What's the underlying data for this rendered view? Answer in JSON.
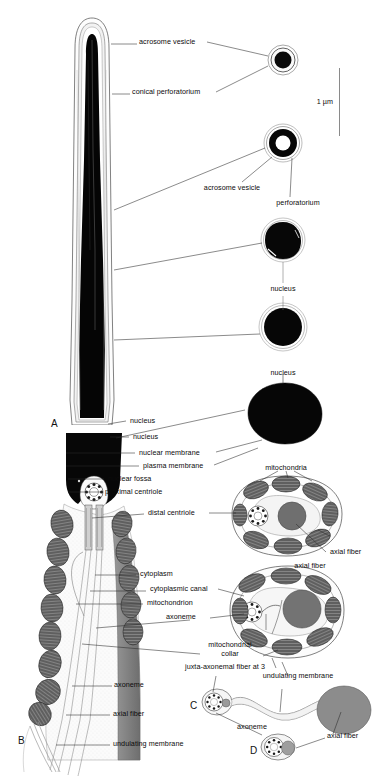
{
  "figure": {
    "scale_bar": {
      "label": "1 µm"
    },
    "panels": [
      {
        "id": "A",
        "label": "A"
      },
      {
        "id": "B",
        "label": "B"
      },
      {
        "id": "C",
        "label": "C"
      },
      {
        "id": "D",
        "label": "D"
      }
    ]
  },
  "labels": {
    "acrosome_vesicle_top": "acrosome vesicle",
    "conical_perforatorium": "conical perforatorium",
    "acrosome_vesicle_mid": "acrosome vesicle",
    "perforatorium": "perforatorium",
    "nucleus_mid": "nucleus",
    "nucleus_large": "nucleus",
    "nucleus_head": "nucleus",
    "nuclear_membrane": "nuclear membrane",
    "plasma_membrane": "plasma membrane",
    "nuclear_fossa": "nuclear fossa",
    "proximal_centriole": "proximal centriole",
    "distal_centriole": "distal centriole",
    "mitochondria": "mitochondria",
    "axial_fiber_x1": "axial fiber",
    "cytoplasm": "cytoplasm",
    "cytoplasmic_canal": "cytoplasmic canal",
    "mitochondrion": "mitochondrion",
    "axoneme_x1": "axoneme",
    "axial_fiber_x2": "axial fiber",
    "mitochondrial_collar_l1": "mitochondrial",
    "mitochondrial_collar_l2": "collar",
    "juxta_axonemal": "juxta-axonemal fiber at 3",
    "undulating_membrane_x1": "undulating membrane",
    "axoneme_b": "axoneme",
    "axial_fiber_b": "axial fiber",
    "undulating_membrane_b": "undulating membrane",
    "axoneme_cd": "axoneme",
    "axial_fiber_d": "axial fiber"
  }
}
